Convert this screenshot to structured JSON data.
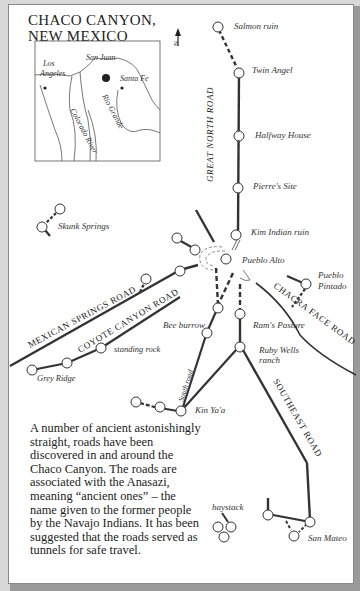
{
  "title": {
    "line1": "CHACO CANYON,",
    "line2": "NEW MEXICO"
  },
  "inset": {
    "labels": {
      "los_angeles_1": "Los",
      "los_angeles_2": "Angeles",
      "san_juan": "San Juan",
      "santa_fe": "Santa Fe",
      "rio_grande": "Rio Grande",
      "colorado_river": "Colorado River"
    }
  },
  "north_arrow": {
    "label": "N"
  },
  "roads": {
    "great_north": "GREAT NORTH ROAD",
    "mexican_springs": "MEXICAN SPRINGS ROAD",
    "coyote_canyon": "COYOTE CANYON ROAD",
    "chacra_face": "CHACRA FACE ROAD",
    "south": "South road",
    "southeast": "SOUTHEAST ROAD"
  },
  "sites": {
    "salmon_ruin": "Salmon ruin",
    "twin_angel": "Twin Angel",
    "halfway_house": "Halfway House",
    "pierres_site": "Pierre's Site",
    "kim_indian_ruin": "Kim Indian ruin",
    "pueblo_alto": "Pueblo Alto",
    "pueblo_pintado_1": "Pueblo",
    "pueblo_pintado_2": "Pintado",
    "skunk_springs": "Skunk Springs",
    "bee_burrow": "Bee burrow",
    "rams_pasture": "Ram's Pasture",
    "ruby_wells_1": "Ruby Wells",
    "ruby_wells_2": "ranch",
    "standing_rock": "standing rock",
    "grey_ridge": "Grey Ridge",
    "kin_yaa": "Kin Ya'a",
    "haystack": "haystack",
    "san_mateo": "San Mateo"
  },
  "description": "A number of ancient astonishingly straight, roads have been discovered in and around the Chaco Canyon. The roads are associated with the Anasazi, meaning “ancient ones” – the name given to the former people by the Navajo Indians. It has been suggested that the roads served as tunnels for safe travel."
}
